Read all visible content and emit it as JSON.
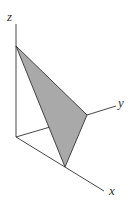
{
  "diagram": {
    "type": "3d-coordinate-plane",
    "axes": {
      "x_label": "x",
      "y_label": "y",
      "z_label": "z"
    },
    "plane_fill_color": "#a9a9a9",
    "stroke_color": "#333333",
    "intercepts": [
      "x-intercept",
      "y-intercept",
      "z-intercept"
    ]
  }
}
